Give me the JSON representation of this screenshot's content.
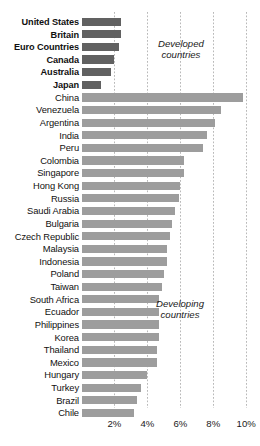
{
  "chart_data": {
    "type": "bar",
    "orientation": "horizontal",
    "title": "",
    "subtitle": "",
    "xlabel": "",
    "ylabel": "",
    "xlim": [
      0,
      10.7
    ],
    "grid": true,
    "grid_axis": "x",
    "legend": "none",
    "tick_labels": [
      "2%",
      "4%",
      "6%",
      "8%",
      "10%"
    ],
    "tick_values": [
      2,
      4,
      6,
      8,
      10
    ],
    "annotations": [
      {
        "text_line1": "Developed",
        "text_line2": "countries"
      },
      {
        "text_line1": "Developing",
        "text_line2": "countries"
      }
    ],
    "colors": {
      "developed_bar": "#616161",
      "developing_bar": "#9d9d9d",
      "gridline": "#b9b9b9",
      "text": "#111111",
      "background": "#ffffff"
    },
    "groups": [
      {
        "name": "Developed countries",
        "bold_labels": true,
        "categories": [
          "United States",
          "Britain",
          "Euro Countries",
          "Canada",
          "Australia",
          "Japan"
        ],
        "values": [
          2.4,
          2.4,
          2.3,
          2.0,
          1.8,
          1.2
        ]
      },
      {
        "name": "Developing countries",
        "bold_labels": false,
        "categories": [
          "China",
          "Venezuela",
          "Argentina",
          "India",
          "Peru",
          "Colombia",
          "Singapore",
          "Hong Kong",
          "Russia",
          "Saudi Arabia",
          "Bulgaria",
          "Czech Republic",
          "Malaysia",
          "Indonesia",
          "Poland",
          "Taiwan",
          "South Africa",
          "Ecuador",
          "Philippines",
          "Korea",
          "Thailand",
          "Mexico",
          "Hungary",
          "Turkey",
          "Brazil",
          "Chile"
        ],
        "values": [
          9.8,
          8.5,
          8.1,
          7.6,
          7.4,
          6.2,
          6.2,
          6.0,
          5.9,
          5.7,
          5.5,
          5.4,
          5.2,
          5.2,
          5.0,
          4.9,
          4.7,
          4.7,
          4.7,
          4.7,
          4.6,
          4.6,
          4.0,
          3.6,
          3.4,
          3.2
        ]
      }
    ],
    "categories": [
      "United States",
      "Britain",
      "Euro Countries",
      "Canada",
      "Australia",
      "Japan",
      "China",
      "Venezuela",
      "Argentina",
      "India",
      "Peru",
      "Colombia",
      "Singapore",
      "Hong Kong",
      "Russia",
      "Saudi Arabia",
      "Bulgaria",
      "Czech Republic",
      "Malaysia",
      "Indonesia",
      "Poland",
      "Taiwan",
      "South Africa",
      "Ecuador",
      "Philippines",
      "Korea",
      "Thailand",
      "Mexico",
      "Hungary",
      "Turkey",
      "Brazil",
      "Chile"
    ],
    "values": [
      2.4,
      2.4,
      2.3,
      2.0,
      1.8,
      1.2,
      9.8,
      8.5,
      8.1,
      7.6,
      7.4,
      6.2,
      6.2,
      6.0,
      5.9,
      5.7,
      5.5,
      5.4,
      5.2,
      5.2,
      5.0,
      4.9,
      4.7,
      4.7,
      4.7,
      4.7,
      4.6,
      4.6,
      4.0,
      3.6,
      3.4,
      3.2
    ]
  }
}
